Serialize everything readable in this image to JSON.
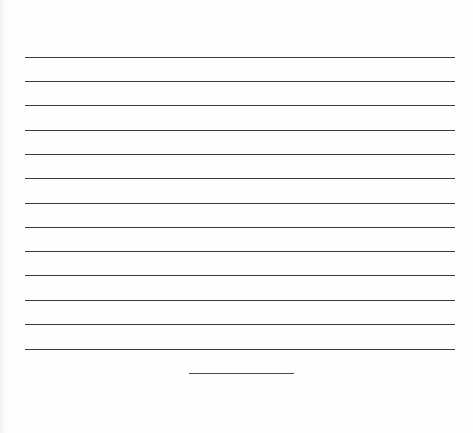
{
  "document": {
    "type": "lined writing sheet",
    "line_count": 13,
    "rule_color": "#3a3a3a",
    "background": "#fefefe",
    "rules_y": [
      57,
      81,
      105,
      130,
      154,
      178,
      203,
      227,
      251,
      275,
      300,
      324,
      349
    ],
    "short_line": {
      "x": 189,
      "y": 373,
      "width": 105
    }
  }
}
